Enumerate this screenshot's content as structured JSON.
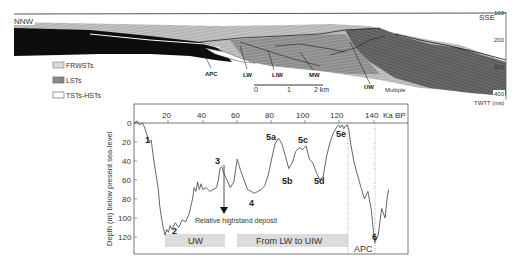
{
  "seismic_profile": {
    "direction_left": "NNW",
    "direction_right": "SSE",
    "twtt_ticks": [
      "100",
      "200",
      "300",
      "400"
    ],
    "twtt_label": "TWTT (ms)",
    "labels": [
      {
        "text": "APC",
        "x": 211,
        "y": 75
      },
      {
        "text": "LW",
        "x": 245,
        "y": 76
      },
      {
        "text": "LIW",
        "x": 277,
        "y": 77
      },
      {
        "text": "MW",
        "x": 313,
        "y": 77
      },
      {
        "text": "UW",
        "x": 369,
        "y": 90
      },
      {
        "text": "Multiple",
        "x": 386,
        "y": 92
      }
    ],
    "scale_bar": {
      "ticks": [
        "0",
        "1",
        "2 km"
      ]
    },
    "legend": [
      {
        "label": "FRWSTs",
        "color": "#d9d9d9"
      },
      {
        "label": "LSTs",
        "color": "#8c8c8c"
      },
      {
        "label": "TSTs-HSTs",
        "color": "#ffffff"
      }
    ]
  },
  "sea_level_chart": {
    "x_unit": "Ka BP",
    "y_axis_label": "Depth (m) below present sea-level",
    "x_ticks": [
      "20",
      "40",
      "60",
      "80",
      "100",
      "120",
      "140"
    ],
    "y_ticks": [
      "0",
      "20",
      "40",
      "60",
      "80",
      "100",
      "120"
    ],
    "stage_labels": [
      {
        "text": "1",
        "age": 8,
        "depth": 20
      },
      {
        "text": "2",
        "age": 18,
        "depth": 118
      },
      {
        "text": "3",
        "age": 50,
        "depth": 46
      },
      {
        "text": "4",
        "age": 67,
        "depth": 78
      },
      {
        "text": "5a",
        "age": 82,
        "depth": 12
      },
      {
        "text": "5b",
        "age": 89,
        "depth": 60
      },
      {
        "text": "5c",
        "age": 98,
        "depth": 22
      },
      {
        "text": "5d",
        "age": 107,
        "depth": 60
      },
      {
        "text": "5e",
        "age": 122,
        "depth": 6
      },
      {
        "text": "6",
        "age": 140,
        "depth": 126
      }
    ],
    "annotation": "Relative highstand deposit",
    "bands": [
      {
        "label": "UW",
        "from_age": 18,
        "to_age": 53
      },
      {
        "label": "From LW  to UIW",
        "from_age": 60,
        "to_age": 124
      },
      {
        "label": "APC",
        "from_age": 124,
        "to_age": 140
      }
    ]
  },
  "chart_data": {
    "type": "line",
    "title": "",
    "xlabel": "Ka BP",
    "ylabel": "Depth (m) below present sea-level",
    "xlim": [
      0,
      158
    ],
    "ylim": [
      0,
      130
    ],
    "y_inverted": true,
    "grid": false,
    "series": [
      {
        "name": "Relative sea level",
        "x": [
          0,
          2,
          3,
          5,
          6,
          8,
          9,
          10,
          11,
          12,
          14,
          15,
          16,
          17,
          18,
          19,
          20,
          21,
          22,
          24,
          26,
          28,
          30,
          32,
          33,
          34,
          35,
          36,
          37,
          38,
          39,
          40,
          42,
          44,
          46,
          48,
          49,
          50,
          51,
          52,
          53,
          54,
          56,
          58,
          60,
          61,
          62,
          64,
          66,
          68,
          70,
          72,
          74,
          76,
          78,
          80,
          82,
          84,
          86,
          88,
          90,
          92,
          94,
          96,
          98,
          100,
          102,
          104,
          106,
          108,
          110,
          112,
          114,
          116,
          118,
          119,
          120,
          121,
          122,
          123,
          124,
          125,
          126,
          128,
          130,
          132,
          134,
          136,
          138,
          139,
          140,
          142,
          144,
          146,
          147,
          148
        ],
        "y": [
          0,
          -2,
          2,
          0,
          4,
          15,
          20,
          18,
          32,
          45,
          68,
          88,
          100,
          110,
          118,
          112,
          115,
          108,
          112,
          105,
          110,
          102,
          104,
          96,
          88,
          80,
          68,
          72,
          62,
          70,
          64,
          70,
          68,
          72,
          70,
          68,
          60,
          48,
          46,
          52,
          56,
          60,
          68,
          62,
          38,
          44,
          50,
          60,
          70,
          72,
          74,
          72,
          70,
          66,
          55,
          38,
          22,
          16,
          22,
          35,
          48,
          42,
          30,
          26,
          28,
          24,
          38,
          42,
          52,
          60,
          56,
          35,
          20,
          10,
          4,
          2,
          5,
          2,
          6,
          3,
          2,
          8,
          22,
          42,
          55,
          68,
          80,
          72,
          92,
          110,
          126,
          118,
          90,
          100,
          82,
          70
        ]
      }
    ],
    "annotations": [
      "1",
      "2",
      "3",
      "4",
      "5a",
      "5b",
      "5c",
      "5d",
      "5e",
      "6",
      "Relative highstand deposit"
    ],
    "x_ticks": [
      20,
      40,
      60,
      80,
      100,
      120,
      140
    ],
    "y_ticks": [
      0,
      20,
      40,
      60,
      80,
      100,
      120
    ]
  }
}
